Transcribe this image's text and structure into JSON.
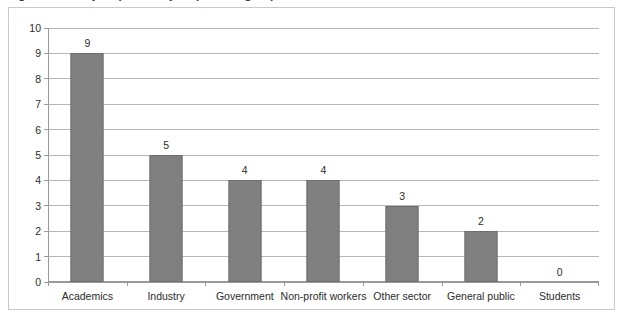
{
  "figure": {
    "title_fragment": "Figure 1: Survey responses by respondent group",
    "title_visible": false
  },
  "chart_data": {
    "type": "bar",
    "title": "",
    "xlabel": "",
    "ylabel": "",
    "categories": [
      "Academics",
      "Industry",
      "Government",
      "Non-profit workers",
      "Other sector",
      "General public",
      "Students"
    ],
    "values": [
      9,
      5,
      4,
      4,
      3,
      2,
      0
    ],
    "value_labels": [
      "9",
      "5",
      "4",
      "4",
      "3",
      "2",
      "0"
    ],
    "ylim": [
      0,
      10
    ],
    "ytick_step": 1,
    "yticks": [
      "10",
      "9",
      "8",
      "7",
      "6",
      "5",
      "4",
      "3",
      "2",
      "1",
      "0"
    ],
    "grid": "horizontal",
    "legend": "none",
    "bar_color": "#808080",
    "bar_border_color": "#6e6e6e",
    "gridline_color": "#b6b6b6",
    "axis_color": "#9a9a9a",
    "frame_color": "#c9c9c9"
  }
}
